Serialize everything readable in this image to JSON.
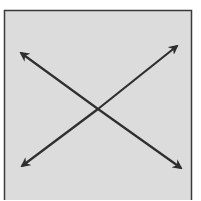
{
  "diagram": {
    "background": "#ffffff",
    "box": {
      "x": 4.5,
      "y": 10.5,
      "width": 187,
      "height": 192,
      "fill": "#dcdcdc",
      "stroke": "#3a3a3a"
    },
    "line_color": "#2e2e2e",
    "arrows": [
      {
        "name": "arrow-to-top-left",
        "from": [
          98,
          109
        ],
        "to": [
          21,
          53
        ]
      },
      {
        "name": "arrow-to-top-right",
        "from": [
          98,
          109
        ],
        "to": [
          177,
          46
        ]
      },
      {
        "name": "arrow-to-bottom-left",
        "from": [
          98,
          109
        ],
        "to": [
          22,
          166
        ]
      },
      {
        "name": "arrow-to-bottom-right",
        "from": [
          98,
          109
        ],
        "to": [
          181,
          168
        ]
      }
    ]
  }
}
